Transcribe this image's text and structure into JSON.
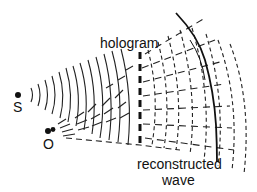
{
  "diagram": {
    "title": "",
    "labels": {
      "hologram": "hologram",
      "source_s": "S",
      "source_o": "O",
      "reconstructed": "reconstructed",
      "wave": "wave"
    },
    "colors": {
      "ink": "#111111",
      "background": "#ffffff"
    },
    "elements": [
      {
        "id": "S",
        "type": "point-source",
        "role": "reference source"
      },
      {
        "id": "O",
        "type": "point-source",
        "role": "object source"
      },
      {
        "id": "hologram",
        "type": "thick dashed line"
      },
      {
        "id": "reconstructed-wave",
        "type": "solid arc"
      },
      {
        "id": "reference-wavefronts",
        "type": "concentric solid arcs from S"
      },
      {
        "id": "object-wavefronts",
        "type": "concentric short arcs from O"
      },
      {
        "id": "diffracted-wavefronts",
        "type": "dashed arcs beyond hologram"
      }
    ]
  }
}
